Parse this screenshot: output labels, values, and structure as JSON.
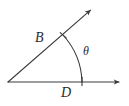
{
  "figure": {
    "kind": "angle-diagram",
    "background_color": "#ffffff",
    "stroke_color": "#3a3a3a",
    "label_color": "#2b2b2b",
    "stroke_width": 1.1,
    "vertex": {
      "x": 8,
      "y": 82
    },
    "rays": [
      {
        "name": "horizontal-ray",
        "from": {
          "x": 8,
          "y": 82
        },
        "to": {
          "x": 122,
          "y": 82
        },
        "arrowhead": "end"
      },
      {
        "name": "diagonal-ray",
        "from": {
          "x": 8,
          "y": 82
        },
        "to": {
          "x": 93,
          "y": 8
        },
        "arrowhead": "end"
      }
    ],
    "arc": {
      "name": "angle-arc",
      "start": {
        "x": 63,
        "y": 35
      },
      "end": {
        "x": 82,
        "y": 82
      },
      "radius": 73,
      "sweep": 1,
      "tick_marks": [
        {
          "x": 63,
          "y": 35,
          "angle_deg": -41
        },
        {
          "x": 82,
          "y": 82,
          "angle_deg": 90
        }
      ]
    },
    "labels": [
      {
        "id": "B",
        "text": "B",
        "x": 35,
        "y": 31,
        "font_size": 14
      },
      {
        "id": "theta",
        "text": "θ",
        "x": 83,
        "y": 45,
        "font_size": 12
      },
      {
        "id": "D",
        "text": "D",
        "x": 61,
        "y": 86,
        "font_size": 14
      }
    ]
  }
}
